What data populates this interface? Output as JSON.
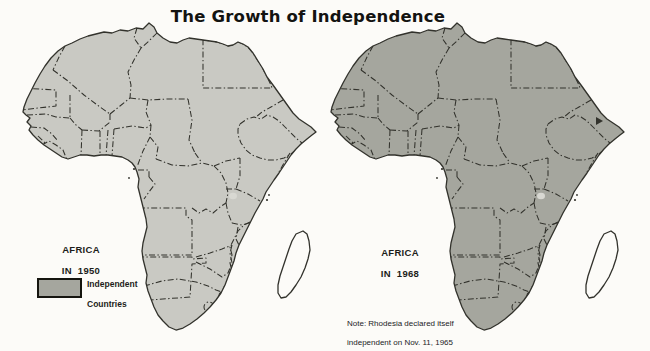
{
  "title": "The Growth of Independence",
  "colors": {
    "independent_fill": "#a5a69e",
    "dependent_fill": "#c9c9c3",
    "coastline": "#32322c",
    "background": "#fcfbf8",
    "lake_fill": "#d8d8d2",
    "legend_border": "#15150f",
    "text": "#1d1d1a"
  },
  "maps": [
    {
      "id": "map-1950",
      "label_line1": "AFRICA",
      "label_line2": "IN 1950",
      "base_color_role": "dependent",
      "shade_color_role": "independent",
      "shaded_regions": [
        "egypt",
        "ethiopia",
        "liberia",
        "south_africa"
      ],
      "enclave_color_role": "dependent",
      "madagascar_color_role": "dependent",
      "djibouti_mark": false,
      "offset_x": 0
    },
    {
      "id": "map-1968",
      "label_line1": "AFRICA",
      "label_line2": "IN 1968",
      "base_color_role": "independent",
      "shade_color_role": "dependent",
      "shaded_regions": [
        "spanish_sahara",
        "angola",
        "south_west_africa",
        "mozambique"
      ],
      "enclave_color_role": null,
      "madagascar_color_role": "independent",
      "djibouti_mark": true,
      "offset_x": 308
    }
  ],
  "legend": {
    "line1": "Independent",
    "line2": "Countries"
  },
  "note": {
    "line1": "Note: Rhodesia declared itself",
    "line2": "independent on Nov. 11, 1965"
  }
}
